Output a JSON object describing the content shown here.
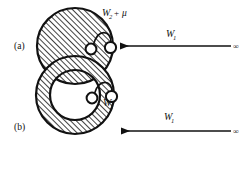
{
  "figure": {
    "background_color": "#ffffff",
    "ink_color": "#111111",
    "width": 247,
    "height": 175,
    "panels": [
      {
        "id": "a",
        "label": "(a)",
        "shape": "hatched-disk",
        "shape_description": "solid hatched disk",
        "region_label": {
          "base": "W",
          "subscript": "2",
          "operator": "+",
          "term": "μ",
          "full_text": "W2 + μ"
        },
        "arrow_label": {
          "base": "W",
          "subscript": "1",
          "full_text": "W1"
        },
        "arrow_origin_label": "∞",
        "arrow_direction": "leftward"
      },
      {
        "id": "b",
        "label": "(b)",
        "shape": "hatched-annulus",
        "shape_description": "hatched annulus with empty interior",
        "region_label": {
          "base": "W",
          "subscript": "2",
          "operator": "",
          "term": "",
          "full_text": "W2"
        },
        "arrow_label": {
          "base": "W",
          "subscript": "1",
          "full_text": "W1"
        },
        "arrow_origin_label": "∞",
        "arrow_direction": "leftward"
      }
    ]
  }
}
